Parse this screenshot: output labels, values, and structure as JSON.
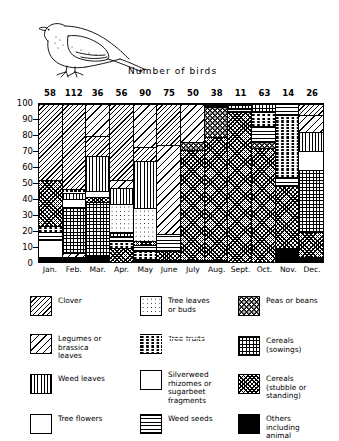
{
  "chart_data": {
    "type": "bar",
    "subtype": "stacked-100-percent",
    "title": "Number of birds",
    "xlabel": "",
    "ylabel": "",
    "ylim": [
      0,
      100
    ],
    "yticks": [
      0,
      10,
      20,
      30,
      40,
      50,
      60,
      70,
      80,
      90,
      100
    ],
    "grid": false,
    "legend_position": "below",
    "categories": [
      "Jan.",
      "Feb.",
      "Mar.",
      "Apr.",
      "May",
      "June",
      "July",
      "Aug.",
      "Sept.",
      "Oct.",
      "Nov.",
      "Dec."
    ],
    "column_counts": [
      58,
      112,
      36,
      56,
      90,
      75,
      50,
      38,
      11,
      63,
      14,
      26
    ],
    "column_count_label": "Number of birds",
    "series": [
      {
        "name": "Clover",
        "key": "clover",
        "values": [
          48,
          56,
          33,
          49,
          27,
          26,
          0,
          0,
          0,
          0,
          0,
          0
        ]
      },
      {
        "name": "Legumes or brassica leaves",
        "key": "legumes",
        "values": [
          0,
          0,
          0,
          0,
          0,
          0,
          0,
          19,
          0,
          0,
          0,
          20
        ]
      },
      {
        "name": "Weed leaves",
        "key": "weedleaves",
        "values": [
          0,
          11,
          22,
          10,
          30,
          0,
          0,
          0,
          0,
          0,
          0,
          12
        ]
      },
      {
        "name": "Tree flowers",
        "key": "treeflowers",
        "values": [
          0,
          0,
          4,
          0,
          0,
          0,
          0,
          0,
          0,
          0,
          0,
          0
        ]
      },
      {
        "name": "Tree leaves or buds",
        "key": "treeleaves",
        "values": [
          0,
          0,
          0,
          18,
          21,
          0,
          0,
          0,
          0,
          0,
          0,
          0
        ]
      },
      {
        "name": "Tree fruits",
        "key": "treefruits",
        "values": [
          4,
          0,
          0,
          4,
          5,
          0,
          0,
          0,
          0,
          0,
          32,
          0
        ]
      },
      {
        "name": "Silverweed rhizomes or sugarbeet fragments",
        "key": "silverweed",
        "values": [
          11,
          0,
          0,
          0,
          0,
          0,
          0,
          0,
          0,
          0,
          0,
          12
        ]
      },
      {
        "name": "Weed seeds",
        "key": "weedseeds",
        "values": [
          5,
          0,
          0,
          0,
          4,
          11,
          0,
          0,
          2,
          20,
          10,
          0
        ]
      },
      {
        "name": "Peas or beans",
        "key": "peas",
        "values": [
          0,
          0,
          0,
          0,
          0,
          0,
          5,
          20,
          0,
          5,
          0,
          0
        ]
      },
      {
        "name": "Cereals (sowings)",
        "key": "cereals_sow",
        "values": [
          0,
          29,
          34,
          0,
          0,
          0,
          0,
          0,
          3,
          0,
          0,
          39
        ]
      },
      {
        "name": "Cereals (stubble or standing)",
        "key": "cereals_stub",
        "values": [
          29,
          1,
          3,
          19,
          11,
          62,
          94,
          60,
          94,
          74,
          48,
          14
        ]
      },
      {
        "name": "Others including animal",
        "key": "others",
        "values": [
          3,
          3,
          4,
          0,
          2,
          1,
          1,
          1,
          1,
          1,
          10,
          3
        ]
      }
    ],
    "stacks": [
      {
        "month": "Jan.",
        "count": 58,
        "segments": [
          {
            "key": "others",
            "from": 0,
            "to": 3
          },
          {
            "key": "silverweed",
            "from": 3,
            "to": 14
          },
          {
            "key": "weedseeds",
            "from": 14,
            "to": 19
          },
          {
            "key": "treefruits",
            "from": 19,
            "to": 23
          },
          {
            "key": "cereals_stub",
            "from": 23,
            "to": 52
          },
          {
            "key": "clover",
            "from": 52,
            "to": 100
          }
        ]
      },
      {
        "month": "Feb.",
        "count": 112,
        "segments": [
          {
            "key": "others",
            "from": 0,
            "to": 3
          },
          {
            "key": "legumes",
            "from": 3,
            "to": 6
          },
          {
            "key": "cereals_sow",
            "from": 6,
            "to": 35
          },
          {
            "key": "silverweed",
            "from": 35,
            "to": 40
          },
          {
            "key": "weedleaves",
            "from": 40,
            "to": 44
          },
          {
            "key": "cereals_stub",
            "from": 44,
            "to": 46
          },
          {
            "key": "clover",
            "from": 46,
            "to": 100
          }
        ]
      },
      {
        "month": "Mar.",
        "count": 36,
        "segments": [
          {
            "key": "others",
            "from": 0,
            "to": 4
          },
          {
            "key": "cereals_sow",
            "from": 4,
            "to": 38
          },
          {
            "key": "cereals_stub",
            "from": 38,
            "to": 41
          },
          {
            "key": "treeflowers",
            "from": 41,
            "to": 45
          },
          {
            "key": "weedleaves",
            "from": 45,
            "to": 67
          },
          {
            "key": "clover",
            "from": 67,
            "to": 80
          },
          {
            "key": "legumes",
            "from": 80,
            "to": 100
          }
        ]
      },
      {
        "month": "Apr.",
        "count": 56,
        "segments": [
          {
            "key": "cereals_stub",
            "from": 0,
            "to": 9
          },
          {
            "key": "treefruits",
            "from": 9,
            "to": 13
          },
          {
            "key": "weedseeds",
            "from": 13,
            "to": 16
          },
          {
            "key": "cereals_sow",
            "from": 16,
            "to": 19
          },
          {
            "key": "treeleaves",
            "from": 19,
            "to": 37
          },
          {
            "key": "weedleaves",
            "from": 37,
            "to": 47
          },
          {
            "key": "legumes",
            "from": 47,
            "to": 52
          },
          {
            "key": "clover",
            "from": 52,
            "to": 100
          }
        ]
      },
      {
        "month": "May",
        "count": 90,
        "segments": [
          {
            "key": "others",
            "from": 0,
            "to": 2
          },
          {
            "key": "treefruits",
            "from": 2,
            "to": 7
          },
          {
            "key": "weedseeds",
            "from": 7,
            "to": 11
          },
          {
            "key": "cereals_stub",
            "from": 11,
            "to": 13
          },
          {
            "key": "treeleaves",
            "from": 13,
            "to": 34
          },
          {
            "key": "weedleaves",
            "from": 34,
            "to": 64
          },
          {
            "key": "clover",
            "from": 64,
            "to": 73
          },
          {
            "key": "legumes",
            "from": 73,
            "to": 100
          }
        ]
      },
      {
        "month": "June",
        "count": 75,
        "segments": [
          {
            "key": "others",
            "from": 0,
            "to": 1
          },
          {
            "key": "cereals_stub",
            "from": 1,
            "to": 7
          },
          {
            "key": "weedseeds",
            "from": 7,
            "to": 18
          },
          {
            "key": "legumes",
            "from": 18,
            "to": 74
          },
          {
            "key": "clover",
            "from": 74,
            "to": 100
          }
        ]
      },
      {
        "month": "July",
        "count": 50,
        "segments": [
          {
            "key": "others",
            "from": 0,
            "to": 1
          },
          {
            "key": "cereals_stub",
            "from": 1,
            "to": 71
          },
          {
            "key": "peas",
            "from": 71,
            "to": 76
          },
          {
            "key": "legumes",
            "from": 76,
            "to": 100
          }
        ]
      },
      {
        "month": "Aug.",
        "count": 38,
        "segments": [
          {
            "key": "others",
            "from": 0,
            "to": 1
          },
          {
            "key": "cereals_stub",
            "from": 1,
            "to": 79
          },
          {
            "key": "peas",
            "from": 79,
            "to": 98
          },
          {
            "key": "others",
            "from": 98,
            "to": 100
          }
        ]
      },
      {
        "month": "Sept.",
        "count": 11,
        "segments": [
          {
            "key": "cereals_stub",
            "from": 0,
            "to": 95
          },
          {
            "key": "weedseeds",
            "from": 95,
            "to": 97
          },
          {
            "key": "cereals_sow",
            "from": 97,
            "to": 100
          }
        ]
      },
      {
        "month": "Oct.",
        "count": 63,
        "segments": [
          {
            "key": "cereals_stub",
            "from": 0,
            "to": 72
          },
          {
            "key": "peas",
            "from": 72,
            "to": 76
          },
          {
            "key": "weedseeds",
            "from": 76,
            "to": 86
          },
          {
            "key": "treefruits",
            "from": 86,
            "to": 95
          },
          {
            "key": "cereals_sow",
            "from": 95,
            "to": 100
          }
        ]
      },
      {
        "month": "Nov.",
        "count": 14,
        "segments": [
          {
            "key": "others",
            "from": 0,
            "to": 9
          },
          {
            "key": "cereals_stub",
            "from": 9,
            "to": 48
          },
          {
            "key": "weedseeds",
            "from": 48,
            "to": 54
          },
          {
            "key": "treefruits",
            "from": 54,
            "to": 93
          },
          {
            "key": "weedseeds",
            "from": 93,
            "to": 100
          }
        ]
      },
      {
        "month": "Dec.",
        "count": 26,
        "segments": [
          {
            "key": "others",
            "from": 0,
            "to": 3
          },
          {
            "key": "cereals_stub",
            "from": 3,
            "to": 19
          },
          {
            "key": "cereals_sow",
            "from": 19,
            "to": 58
          },
          {
            "key": "silverweed",
            "from": 58,
            "to": 70
          },
          {
            "key": "weedleaves",
            "from": 70,
            "to": 82
          },
          {
            "key": "legumes",
            "from": 82,
            "to": 93
          },
          {
            "key": "clover",
            "from": 93,
            "to": 100
          }
        ]
      }
    ]
  },
  "legend": {
    "columns": [
      {
        "items": [
          {
            "key": "clover",
            "label": "Clover"
          },
          {
            "key": "legumes",
            "label": "Legumes or\nbrassica\nleaves"
          },
          {
            "key": "weedleaves",
            "label": "Weed leaves"
          },
          {
            "key": "treeflowers",
            "label": "Tree flowers"
          }
        ]
      },
      {
        "items": [
          {
            "key": "treeleaves",
            "label": "Tree leaves\nor buds"
          },
          {
            "key": "treefruits",
            "label": "Tree fruits"
          },
          {
            "key": "silverweed",
            "label": "Silverweed\nrhizomes or\nsugarbeet\nfragments"
          },
          {
            "key": "weedseeds",
            "label": "Weed seeds"
          }
        ]
      },
      {
        "items": [
          {
            "key": "peas",
            "label": "Peas or beans"
          },
          {
            "key": "cereals_sow",
            "label": "Cereals\n(sowings)"
          },
          {
            "key": "cereals_stub",
            "label": "Cereals\n(stubble or\nstanding)"
          },
          {
            "key": "others",
            "label": "Others\nincluding\nanimal"
          }
        ]
      }
    ]
  },
  "illustration": {
    "name": "pigeon-line-drawing"
  }
}
